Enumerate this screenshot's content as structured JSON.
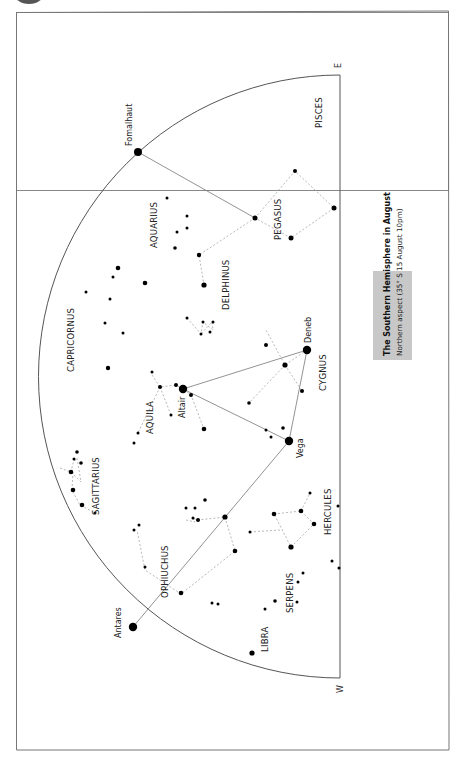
{
  "title_box": {
    "title": "The Southern Hemisphere in August",
    "subtitle": "Northern aspect (35° S 15 August 10pm)",
    "bg": "#c8c8c8"
  },
  "directions": {
    "east": "E",
    "west": "W"
  },
  "constellations": [
    {
      "name": "PISCES",
      "x": 318,
      "y": 112
    },
    {
      "name": "PEGASUS",
      "x": 281,
      "y": 230
    },
    {
      "name": "AQUARIUS",
      "x": 156,
      "y": 220
    },
    {
      "name": "DELPHINUS",
      "x": 229,
      "y": 297
    },
    {
      "name": "CAPRICORNUS",
      "x": 72,
      "y": 330
    },
    {
      "name": "CYGNUS",
      "x": 324,
      "y": 352
    },
    {
      "name": "AQUILA",
      "x": 153,
      "y": 400
    },
    {
      "name": "SAGITTARIUS",
      "x": 98,
      "y": 483
    },
    {
      "name": "HERCULES",
      "x": 329,
      "y": 502
    },
    {
      "name": "OPHIUCHUS",
      "x": 168,
      "y": 575
    },
    {
      "name": "SERPENS",
      "x": 292,
      "y": 598
    },
    {
      "name": "LIBRA",
      "x": 266,
      "y": 640
    }
  ],
  "bright_stars": [
    {
      "name": "Fomalhaut",
      "x": 138,
      "y": 152,
      "label_x": 130,
      "label_y": 145
    },
    {
      "name": "Deneb",
      "x": 307,
      "y": 350,
      "label_x": 310,
      "label_y": 336
    },
    {
      "name": "Altair",
      "x": 183,
      "y": 389,
      "label_x": 183,
      "label_y": 405
    },
    {
      "name": "Vega",
      "x": 289,
      "y": 441,
      "label_x": 301,
      "label_y": 455
    },
    {
      "name": "Antares",
      "x": 133,
      "y": 627,
      "label_x": 123,
      "label_y": 620
    }
  ],
  "colors": {
    "line": "#666666",
    "dashed": "#888888",
    "star": "#000000",
    "frame": "#777777"
  }
}
